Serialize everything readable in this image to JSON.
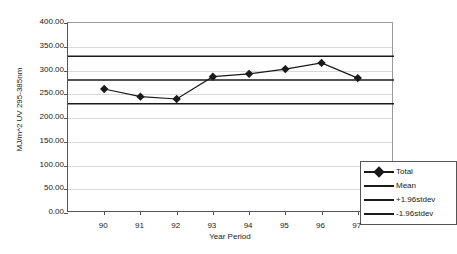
{
  "chart_data": {
    "type": "line",
    "title": "",
    "xlabel": "Year Period",
    "ylabel": "MJ/m^2 UV 295-385nm",
    "categories": [
      "90",
      "91",
      "92",
      "93",
      "94",
      "95",
      "96",
      "97"
    ],
    "xlim": [
      0,
      9
    ],
    "ylim": [
      0,
      400
    ],
    "ytick_labels": [
      "0.00",
      "50.00",
      "100.00",
      "150.00",
      "200.00",
      "250.00",
      "300.00",
      "350.00",
      "400.00"
    ],
    "ytick_values": [
      0,
      50,
      100,
      150,
      200,
      250,
      300,
      350,
      400
    ],
    "grid": true,
    "legend_position": "inside-bottom-right",
    "series": [
      {
        "name": "Total",
        "marker": "diamond",
        "values": [
          261,
          245,
          240,
          287,
          293,
          303,
          316,
          284
        ]
      },
      {
        "name": "Mean",
        "marker": "none",
        "constant": 280,
        "values": [
          280,
          280,
          280,
          280,
          280,
          280,
          280,
          280
        ]
      },
      {
        "name": "+1.96stdev",
        "marker": "none",
        "constant": 330,
        "values": [
          330,
          330,
          330,
          330,
          330,
          330,
          330,
          330
        ]
      },
      {
        "name": "-1.96stdev",
        "marker": "none",
        "constant": 230,
        "values": [
          230,
          230,
          230,
          230,
          230,
          230,
          230,
          230
        ]
      }
    ],
    "legend": [
      {
        "label": "Total",
        "marker": "diamond",
        "color": "#1a1a1a"
      },
      {
        "label": "Mean",
        "marker": "none",
        "color": "#1a1a1a"
      },
      {
        "label": "+1.96stdev",
        "marker": "none",
        "color": "#1a1a1a"
      },
      {
        "label": "-1.96stdev",
        "marker": "none",
        "color": "#1a1a1a"
      }
    ],
    "colors": {
      "series_line": "#1a1a1a",
      "grid": "#d9d9d9",
      "axis": "#555555",
      "background": "#ffffff"
    }
  }
}
